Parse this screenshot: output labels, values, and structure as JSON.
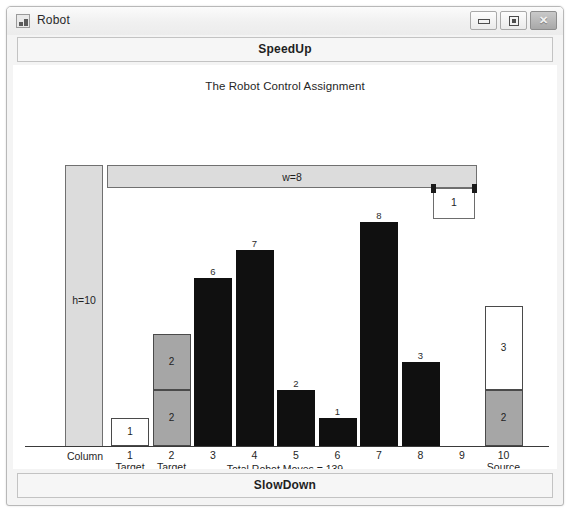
{
  "window": {
    "title": "Robot",
    "icon": "robot-icon",
    "controls": {
      "minimize": "–",
      "maximize": "□",
      "close": "✕"
    }
  },
  "toolbar": {
    "speedup_label": "SpeedUp",
    "slowdown_label": "SlowDown"
  },
  "canvas": {
    "title": "The Robot Control Assignment",
    "height_rail_label": "h=10",
    "width_rail_label": "w=8",
    "robot_label": "1",
    "column_axis_label": "Column",
    "moves_label": "Total Robot Moves = 139"
  },
  "colors": {
    "dark_block": "#101010",
    "gray_block": "#a6a6a6",
    "white_block": "#ffffff",
    "rail_fill": "#dcdcdc",
    "outline": "#4a4a4a",
    "window_chrome": "#f0f0f0"
  },
  "chart_data": {
    "type": "bar",
    "title": "The Robot Control Assignment",
    "xlabel": "Column",
    "ylabel": "",
    "ylim": [
      0,
      10
    ],
    "grid": false,
    "legend": "none",
    "annotations": [
      "h=10",
      "w=8",
      "Total Robot Moves = 139"
    ],
    "categories": [
      "1",
      "2",
      "3",
      "4",
      "5",
      "6",
      "7",
      "8",
      "9",
      "10"
    ],
    "category_sublabels": [
      "Target\nOdd",
      "Target\nEven",
      "",
      "",
      "",
      "",
      "",
      "",
      "",
      "Source"
    ],
    "values": [
      1,
      4,
      6,
      7,
      2,
      1,
      8,
      3,
      0,
      5
    ],
    "columns": [
      {
        "index": 1,
        "label": "1",
        "sublabel_line1": "Target",
        "sublabel_line2": "Odd",
        "total": 1,
        "top_label": "",
        "segments": [
          {
            "value": 1,
            "label": "1",
            "style": "white"
          }
        ]
      },
      {
        "index": 2,
        "label": "2",
        "sublabel_line1": "Target",
        "sublabel_line2": "Even",
        "total": 4,
        "top_label": "",
        "segments": [
          {
            "value": 2,
            "label": "2",
            "style": "gray"
          },
          {
            "value": 2,
            "label": "2",
            "style": "gray"
          }
        ]
      },
      {
        "index": 3,
        "label": "3",
        "sublabel_line1": "",
        "sublabel_line2": "",
        "total": 6,
        "top_label": "6",
        "segments": [
          {
            "value": 6,
            "label": "",
            "style": "dark"
          }
        ]
      },
      {
        "index": 4,
        "label": "4",
        "sublabel_line1": "",
        "sublabel_line2": "",
        "total": 7,
        "top_label": "7",
        "segments": [
          {
            "value": 7,
            "label": "",
            "style": "dark"
          }
        ]
      },
      {
        "index": 5,
        "label": "5",
        "sublabel_line1": "",
        "sublabel_line2": "",
        "total": 2,
        "top_label": "2",
        "segments": [
          {
            "value": 2,
            "label": "",
            "style": "dark"
          }
        ]
      },
      {
        "index": 6,
        "label": "6",
        "sublabel_line1": "",
        "sublabel_line2": "",
        "total": 1,
        "top_label": "1",
        "segments": [
          {
            "value": 1,
            "label": "",
            "style": "dark"
          }
        ]
      },
      {
        "index": 7,
        "label": "7",
        "sublabel_line1": "",
        "sublabel_line2": "",
        "total": 8,
        "top_label": "8",
        "segments": [
          {
            "value": 8,
            "label": "",
            "style": "dark"
          }
        ]
      },
      {
        "index": 8,
        "label": "8",
        "sublabel_line1": "",
        "sublabel_line2": "",
        "total": 3,
        "top_label": "3",
        "segments": [
          {
            "value": 3,
            "label": "",
            "style": "dark"
          }
        ]
      },
      {
        "index": 9,
        "label": "9",
        "sublabel_line1": "",
        "sublabel_line2": "",
        "total": 0,
        "top_label": "",
        "segments": []
      },
      {
        "index": 10,
        "label": "10",
        "sublabel_line1": "Source",
        "sublabel_line2": "",
        "total": 5,
        "top_label": "",
        "segments": [
          {
            "value": 3,
            "label": "3",
            "style": "white"
          },
          {
            "value": 2,
            "label": "2",
            "style": "gray"
          }
        ]
      }
    ]
  }
}
